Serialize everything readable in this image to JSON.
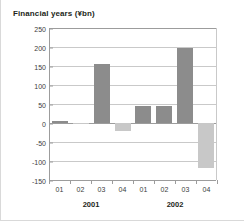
{
  "chart_data": {
    "type": "bar",
    "title": "Financial years (¥bn)",
    "xlabel": "",
    "ylabel": "",
    "ylim": [
      -150,
      250
    ],
    "ytick_step": 50,
    "yticks": [
      250,
      200,
      150,
      100,
      50,
      0,
      -50,
      -100,
      -150
    ],
    "ytick_labels": [
      "250",
      "200",
      "150",
      "100",
      "50",
      "0",
      "-50",
      "-100",
      "-150"
    ],
    "grid": true,
    "legend": "none",
    "categories": [
      "01",
      "02",
      "03",
      "04",
      "01",
      "02",
      "03",
      "04"
    ],
    "values": [
      5,
      -3,
      155,
      -20,
      46,
      44,
      198,
      -118
    ],
    "groups": [
      {
        "label": "2001",
        "categories": [
          "01",
          "02",
          "03",
          "04"
        ]
      },
      {
        "label": "2002",
        "categories": [
          "01",
          "02",
          "03",
          "04"
        ]
      }
    ],
    "colors": {
      "positive": "#8c8c8c",
      "negative": "#c8c8c8",
      "axis": "#9c9c9c",
      "grid": "#c9c9c9",
      "text": "#231f20",
      "background": "#ffffff"
    }
  }
}
